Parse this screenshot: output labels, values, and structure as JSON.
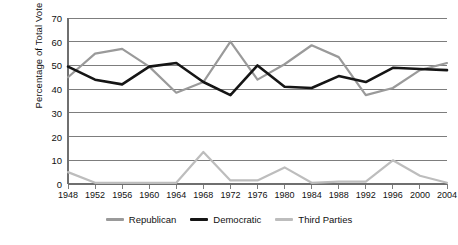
{
  "chart_data": {
    "type": "line",
    "title": "",
    "xlabel": "",
    "ylabel": "Percentage of Total Vote",
    "ylim": [
      0,
      70
    ],
    "yticks": [
      0,
      10,
      20,
      30,
      40,
      50,
      60,
      70
    ],
    "grid": true,
    "legend_position": "bottom",
    "categories": [
      "1948",
      "1952",
      "1956",
      "1960",
      "1964",
      "1968",
      "1972",
      "1976",
      "1980",
      "1984",
      "1988",
      "1992",
      "1996",
      "2000",
      "2004"
    ],
    "series": [
      {
        "name": "Republican",
        "color": "#9a9a9a",
        "values": [
          45,
          55,
          57,
          49.5,
          38.5,
          43,
          60,
          44,
          50.5,
          58.5,
          53.5,
          37.5,
          40.5,
          48,
          51
        ]
      },
      {
        "name": "Democratic",
        "color": "#151515",
        "values": [
          49.5,
          44,
          42,
          49.5,
          51,
          43,
          37.5,
          50,
          41,
          40.5,
          45.5,
          43,
          49,
          48.5,
          48
        ]
      },
      {
        "name": "Third Parties",
        "color": "#bdbdbd",
        "values": [
          5,
          0.5,
          0.5,
          0.5,
          0.5,
          13.5,
          1.5,
          1.5,
          7,
          0.5,
          1,
          1,
          10,
          3.5,
          0.5
        ]
      }
    ]
  },
  "axis": {
    "y_title": "Percentage of Total Vote"
  },
  "legend": {
    "items": [
      {
        "label": "Republican"
      },
      {
        "label": "Democratic"
      },
      {
        "label": "Third Parties"
      }
    ]
  },
  "colors": {
    "republican": "#9a9a9a",
    "democratic": "#151515",
    "third_parties": "#bdbdbd",
    "gridline": "#6f6f6f",
    "axis": "#6f6f6f",
    "background": "#ffffff"
  }
}
